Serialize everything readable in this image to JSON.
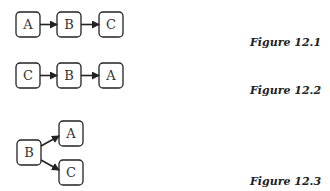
{
  "figures": [
    {
      "caption": "Figure 12.1",
      "nodes": [
        "A",
        "B",
        "C"
      ],
      "edges": [
        [
          "A",
          "B"
        ],
        [
          "B",
          "C"
        ]
      ]
    },
    {
      "caption": "Figure 12.2",
      "nodes": [
        "C",
        "B",
        "A"
      ],
      "edges": [
        [
          "C",
          "B"
        ],
        [
          "B",
          "A"
        ]
      ]
    },
    {
      "caption": "Figure 12.3",
      "nodes": [
        "B",
        "A",
        "C"
      ],
      "edges": [
        [
          "B",
          "A"
        ],
        [
          "B",
          "C"
        ]
      ]
    }
  ],
  "colors": {
    "stroke": "#222222",
    "text": "#333333"
  }
}
